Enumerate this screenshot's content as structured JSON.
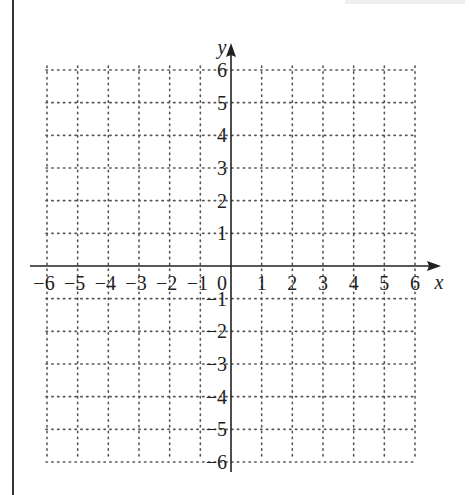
{
  "diagram": {
    "type": "coordinate-grid",
    "x_axis": {
      "label": "x",
      "min": -6,
      "max": 6,
      "ticks": [
        -6,
        -5,
        -4,
        -3,
        -2,
        -1,
        0,
        1,
        2,
        3,
        4,
        5,
        6
      ]
    },
    "y_axis": {
      "label": "y",
      "min": -6,
      "max": 6,
      "ticks": [
        -6,
        -5,
        -4,
        -3,
        -2,
        -1,
        1,
        2,
        3,
        4,
        5,
        6
      ]
    },
    "origin_label": "0",
    "grid": {
      "style": "dotted",
      "step": 1
    },
    "colors": {
      "axis": "#222222",
      "grid": "#555555",
      "background": "#ffffff"
    }
  }
}
